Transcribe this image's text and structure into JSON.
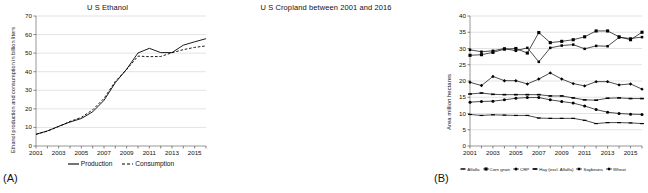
{
  "figure": {
    "panel_a_label": "(A)",
    "panel_b_label": "(B)"
  },
  "chart_data": [
    {
      "id": "us-ethanol",
      "type": "line",
      "title": "U S Ethanol",
      "xlabel": "",
      "ylabel": "Ethanol production and consumption in billion liters",
      "xlim": [
        2001,
        2016
      ],
      "ylim": [
        0,
        70
      ],
      "yticks": [
        0,
        10,
        20,
        30,
        40,
        50,
        60,
        70
      ],
      "xticks": [
        2001,
        2003,
        2005,
        2007,
        2009,
        2011,
        2013,
        2015
      ],
      "grid": true,
      "legend_position": "bottom",
      "x": [
        2001,
        2002,
        2003,
        2004,
        2005,
        2006,
        2007,
        2008,
        2009,
        2010,
        2011,
        2012,
        2013,
        2014,
        2015,
        2016
      ],
      "series": [
        {
          "name": "Production",
          "style": "solid",
          "values": [
            6.3,
            8.1,
            10.6,
            12.9,
            14.8,
            18.4,
            24.6,
            34.1,
            41.4,
            50.1,
            52.6,
            50.3,
            50.3,
            54.3,
            56.1,
            57.8
          ]
        },
        {
          "name": "Consumption",
          "style": "dashed",
          "values": [
            6.3,
            8.0,
            10.5,
            13.2,
            15.4,
            19.5,
            25.6,
            34.8,
            41.2,
            48.4,
            48.1,
            48.2,
            50.2,
            51.9,
            53.1,
            53.9
          ]
        }
      ]
    },
    {
      "id": "us-cropland",
      "type": "line",
      "title": "U S Cropland between 2001 and 2016",
      "xlabel": "",
      "ylabel": "Area million hectares",
      "xlim": [
        2001,
        2016
      ],
      "ylim": [
        0,
        40
      ],
      "yticks": [
        0,
        5,
        10,
        15,
        20,
        25,
        30,
        35,
        40
      ],
      "xticks": [
        2001,
        2003,
        2005,
        2007,
        2009,
        2011,
        2013,
        2015
      ],
      "grid": true,
      "legend_position": "bottom",
      "x": [
        2001,
        2002,
        2003,
        2004,
        2005,
        2006,
        2007,
        2008,
        2009,
        2010,
        2011,
        2012,
        2013,
        2014,
        2015,
        2016
      ],
      "series": [
        {
          "name": "Alfalfa",
          "marker": "dash",
          "values": [
            9.7,
            9.4,
            9.6,
            9.5,
            9.4,
            9.4,
            8.6,
            8.5,
            8.5,
            8.5,
            7.9,
            6.9,
            7.2,
            7.2,
            7.1,
            6.9
          ]
        },
        {
          "name": "Corn grain",
          "marker": "square",
          "values": [
            27.9,
            28.1,
            28.8,
            29.8,
            30.0,
            28.6,
            34.9,
            31.8,
            32.2,
            32.7,
            33.6,
            35.4,
            35.4,
            33.6,
            32.7,
            35.0
          ]
        },
        {
          "name": "CRP",
          "marker": "circle",
          "values": [
            13.5,
            13.7,
            13.8,
            14.2,
            14.7,
            14.9,
            14.9,
            14.2,
            13.7,
            13.2,
            12.3,
            11.2,
            10.4,
            10.0,
            9.8,
            9.7
          ]
        },
        {
          "name": "Hay (excl. Alfalfa)",
          "marker": "bar",
          "values": [
            16.0,
            16.3,
            15.9,
            15.8,
            15.8,
            15.8,
            15.8,
            15.4,
            15.4,
            14.8,
            14.2,
            14.1,
            14.7,
            14.8,
            14.6,
            14.6
          ]
        },
        {
          "name": "Soybeans",
          "marker": "square-small",
          "values": [
            29.6,
            29.0,
            29.3,
            30.0,
            29.3,
            30.2,
            25.9,
            30.2,
            30.9,
            31.2,
            29.9,
            30.8,
            30.7,
            33.4,
            33.1,
            33.5
          ]
        },
        {
          "name": "Wheat",
          "marker": "diamond",
          "values": [
            19.6,
            18.6,
            21.4,
            20.1,
            20.1,
            19.1,
            20.6,
            22.5,
            20.6,
            19.2,
            18.5,
            19.8,
            19.8,
            18.8,
            19.1,
            17.5
          ]
        }
      ]
    }
  ]
}
